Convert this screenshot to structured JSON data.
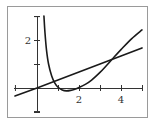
{
  "chart_data": {
    "type": "line",
    "title": "",
    "xlabel": "",
    "ylabel": "",
    "xlim": [
      -1,
      5
    ],
    "ylim": [
      -1,
      3
    ],
    "grid": false,
    "legend": null,
    "x_ticks": [
      1,
      2,
      3,
      4,
      5
    ],
    "x_tick_labels": [
      {
        "value": 2,
        "label": "2"
      },
      {
        "value": 4,
        "label": "4"
      }
    ],
    "y_ticks": [
      -1,
      1,
      2,
      3
    ],
    "y_tick_labels": [
      {
        "value": 2,
        "label": "2"
      }
    ],
    "series": [
      {
        "name": "straight line",
        "style": "line",
        "x": [
          -1.05,
          0,
          1,
          2,
          3,
          4,
          5
        ],
        "y": [
          -0.33,
          0,
          0.33,
          0.67,
          1.0,
          1.33,
          1.67
        ]
      },
      {
        "name": "curve",
        "style": "curve",
        "x": [
          0.33,
          0.38,
          0.45,
          0.55,
          0.7,
          0.85,
          1.0,
          1.2,
          1.4,
          1.6,
          1.8,
          2.0,
          2.3,
          2.6,
          3.0,
          3.3,
          3.6,
          4.0,
          4.5,
          5.0
        ],
        "y": [
          3.0,
          2.3,
          1.6,
          1.0,
          0.5,
          0.2,
          0.03,
          -0.08,
          -0.12,
          -0.1,
          -0.05,
          0.02,
          0.15,
          0.33,
          0.65,
          0.93,
          1.22,
          1.6,
          2.05,
          2.42
        ]
      }
    ],
    "intersections": [
      {
        "x": 0.75,
        "y": 0.25
      },
      {
        "x": 3.6,
        "y": 1.2
      }
    ]
  }
}
